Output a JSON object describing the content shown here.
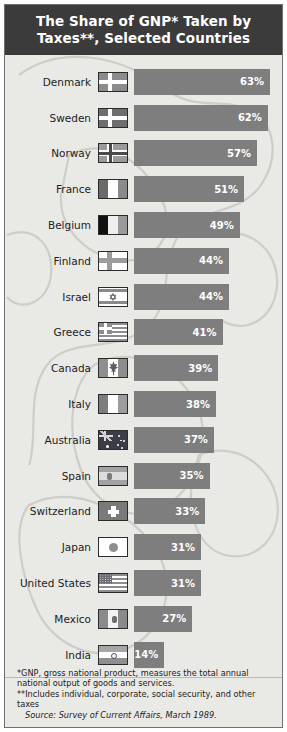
{
  "header": {
    "title": "The Share of GNP* Taken by Taxes**, Selected Countries"
  },
  "chart_data": {
    "type": "bar",
    "title": "The Share of GNP* Taken by Taxes**, Selected Countries",
    "orientation": "horizontal",
    "xlabel": "",
    "ylabel": "",
    "xlim": [
      0,
      63
    ],
    "grid": false,
    "legend": false,
    "unit": "%",
    "categories": [
      "Denmark",
      "Sweden",
      "Norway",
      "France",
      "Belgium",
      "Finland",
      "Israel",
      "Greece",
      "Canada",
      "Italy",
      "Australia",
      "Spain",
      "Switzerland",
      "Japan",
      "United States",
      "Mexico",
      "India"
    ],
    "values": [
      63,
      62,
      57,
      51,
      49,
      44,
      44,
      41,
      39,
      38,
      37,
      35,
      33,
      31,
      31,
      27,
      14
    ],
    "labels": [
      "63%",
      "62%",
      "57%",
      "51%",
      "49%",
      "44%",
      "44%",
      "41%",
      "39%",
      "38%",
      "37%",
      "35%",
      "33%",
      "31%",
      "31%",
      "27%",
      "14%"
    ],
    "rows": [
      {
        "country": "Denmark",
        "value": 63,
        "label": "63%",
        "flag": "flag-denmark"
      },
      {
        "country": "Sweden",
        "value": 62,
        "label": "62%",
        "flag": "flag-sweden"
      },
      {
        "country": "Norway",
        "value": 57,
        "label": "57%",
        "flag": "flag-norway"
      },
      {
        "country": "France",
        "value": 51,
        "label": "51%",
        "flag": "flag-france"
      },
      {
        "country": "Belgium",
        "value": 49,
        "label": "49%",
        "flag": "flag-belgium"
      },
      {
        "country": "Finland",
        "value": 44,
        "label": "44%",
        "flag": "flag-finland"
      },
      {
        "country": "Israel",
        "value": 44,
        "label": "44%",
        "flag": "flag-israel"
      },
      {
        "country": "Greece",
        "value": 41,
        "label": "41%",
        "flag": "flag-greece"
      },
      {
        "country": "Canada",
        "value": 39,
        "label": "39%",
        "flag": "flag-canada"
      },
      {
        "country": "Italy",
        "value": 38,
        "label": "38%",
        "flag": "flag-italy"
      },
      {
        "country": "Australia",
        "value": 37,
        "label": "37%",
        "flag": "flag-australia"
      },
      {
        "country": "Spain",
        "value": 35,
        "label": "35%",
        "flag": "flag-spain"
      },
      {
        "country": "Switzerland",
        "value": 33,
        "label": "33%",
        "flag": "flag-switzerland"
      },
      {
        "country": "Japan",
        "value": 31,
        "label": "31%",
        "flag": "flag-japan"
      },
      {
        "country": "United States",
        "value": 31,
        "label": "31%",
        "flag": "flag-united-states"
      },
      {
        "country": "Mexico",
        "value": 27,
        "label": "27%",
        "flag": "flag-mexico"
      },
      {
        "country": "India",
        "value": 14,
        "label": "14%",
        "flag": "flag-india"
      }
    ]
  },
  "notes": {
    "gnp": "*GNP, gross national product, measures the total annual national output of goods and services.",
    "taxes": "**Includes individual, corporate, social security, and other taxes",
    "source": "Source: Survey of Current Affairs, March 1989."
  },
  "colors": {
    "header_bg": "#3b3b3b",
    "header_text": "#ffffff",
    "bar": "#7e7e7e",
    "bar_text": "#ffffff",
    "page_bg": "#e9e9e6",
    "border": "#6f6f6f"
  }
}
